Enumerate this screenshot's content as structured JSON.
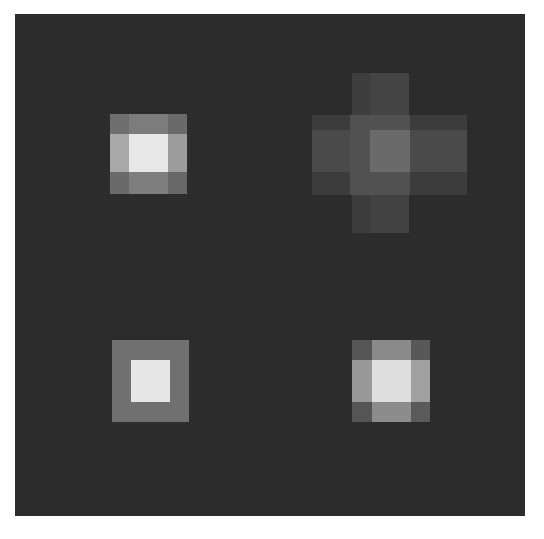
{
  "image": {
    "description": "Grayscale image of four blurred square light patches on a dark square field",
    "background_color": "#ffffff",
    "field": {
      "x": 15,
      "y": 14,
      "w": 510,
      "h": 502,
      "color": "#2b2b2b"
    },
    "patches": [
      {
        "name": "patch-top-left",
        "cells": [
          {
            "x": 110,
            "y": 114,
            "w": 19,
            "h": 20,
            "c": "#6e6e6e"
          },
          {
            "x": 129,
            "y": 114,
            "w": 39,
            "h": 20,
            "c": "#7c7c7c"
          },
          {
            "x": 168,
            "y": 114,
            "w": 19,
            "h": 20,
            "c": "#6a6a6a"
          },
          {
            "x": 110,
            "y": 134,
            "w": 19,
            "h": 38,
            "c": "#a8a8a8"
          },
          {
            "x": 129,
            "y": 134,
            "w": 39,
            "h": 38,
            "c": "#e8e8e8"
          },
          {
            "x": 168,
            "y": 134,
            "w": 19,
            "h": 38,
            "c": "#9c9c9c"
          },
          {
            "x": 110,
            "y": 172,
            "w": 19,
            "h": 22,
            "c": "#6a6a6a"
          },
          {
            "x": 129,
            "y": 172,
            "w": 39,
            "h": 22,
            "c": "#7e7e7e"
          },
          {
            "x": 168,
            "y": 172,
            "w": 19,
            "h": 22,
            "c": "#686868"
          }
        ]
      },
      {
        "name": "patch-top-right-cross",
        "cells": [
          {
            "x": 352,
            "y": 73,
            "w": 57,
            "h": 42,
            "c": "#3e3e3e"
          },
          {
            "x": 370,
            "y": 73,
            "w": 39,
            "h": 42,
            "c": "#444444"
          },
          {
            "x": 312,
            "y": 115,
            "w": 155,
            "h": 80,
            "c": "#3c3c3c"
          },
          {
            "x": 312,
            "y": 130,
            "w": 155,
            "h": 42,
            "c": "#4a4a4a"
          },
          {
            "x": 350,
            "y": 115,
            "w": 60,
            "h": 80,
            "c": "#515151"
          },
          {
            "x": 370,
            "y": 130,
            "w": 40,
            "h": 42,
            "c": "#6a6a6a"
          },
          {
            "x": 352,
            "y": 195,
            "w": 57,
            "h": 38,
            "c": "#3c3c3c"
          },
          {
            "x": 370,
            "y": 195,
            "w": 39,
            "h": 38,
            "c": "#424242"
          }
        ]
      },
      {
        "name": "patch-bottom-left",
        "cells": [
          {
            "x": 112,
            "y": 340,
            "w": 77,
            "h": 82,
            "c": "#707070"
          },
          {
            "x": 131,
            "y": 360,
            "w": 39,
            "h": 42,
            "c": "#e6e6e6"
          }
        ]
      },
      {
        "name": "patch-bottom-right",
        "cells": [
          {
            "x": 352,
            "y": 340,
            "w": 20,
            "h": 20,
            "c": "#555555"
          },
          {
            "x": 372,
            "y": 340,
            "w": 39,
            "h": 20,
            "c": "#8a8a8a"
          },
          {
            "x": 411,
            "y": 340,
            "w": 19,
            "h": 20,
            "c": "#585858"
          },
          {
            "x": 352,
            "y": 360,
            "w": 20,
            "h": 42,
            "c": "#999999"
          },
          {
            "x": 372,
            "y": 360,
            "w": 39,
            "h": 42,
            "c": "#dedede"
          },
          {
            "x": 411,
            "y": 360,
            "w": 19,
            "h": 42,
            "c": "#a0a0a0"
          },
          {
            "x": 352,
            "y": 402,
            "w": 20,
            "h": 20,
            "c": "#555555"
          },
          {
            "x": 372,
            "y": 402,
            "w": 39,
            "h": 20,
            "c": "#8c8c8c"
          },
          {
            "x": 411,
            "y": 402,
            "w": 19,
            "h": 20,
            "c": "#5a5a5a"
          }
        ]
      }
    ]
  }
}
